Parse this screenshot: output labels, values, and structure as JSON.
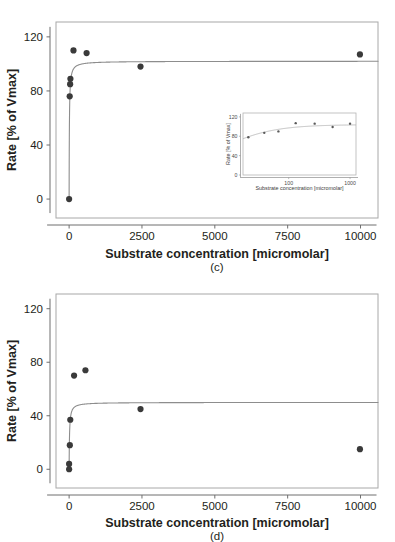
{
  "figure": {
    "caption_c": "(c)",
    "caption_d": "(d)"
  },
  "chart_data": [
    {
      "id": "panel-c",
      "type": "scatter",
      "title": "",
      "panel_label": "(c)",
      "xlabel": "Substrate concentration [micromolar]",
      "ylabel": "Rate [% of Vmax]",
      "xlim": [
        -450,
        10600
      ],
      "ylim": [
        -14,
        131
      ],
      "xticks": [
        0,
        2500,
        5000,
        7500,
        10000
      ],
      "xticklabels": [
        "0",
        "2500",
        "5000",
        "7500",
        "10000"
      ],
      "yticks": [
        0,
        40,
        80,
        120
      ],
      "yticklabels": [
        "0",
        "40",
        "80",
        "120"
      ],
      "grid": false,
      "legend": "none",
      "points": [
        {
          "x": 0,
          "y": 0
        },
        {
          "x": 20,
          "y": 76
        },
        {
          "x": 35,
          "y": 85
        },
        {
          "x": 45,
          "y": 89
        },
        {
          "x": 150,
          "y": 110
        },
        {
          "x": 600,
          "y": 108
        },
        {
          "x": 2450,
          "y": 98
        },
        {
          "x": 9980,
          "y": 107
        }
      ],
      "fit": {
        "model": "michaelis-menten",
        "vmax_percent": 102,
        "km_micromolar": 9,
        "description": "saturation curve rising steeply near zero then plateau at ~102"
      }
    },
    {
      "id": "panel-c-inset",
      "type": "scatter",
      "title": "",
      "xlabel": "Substrate concentration [micromolar]",
      "ylabel": "Rate [% of Vmax]",
      "xscale": "log",
      "xlim": [
        18,
        1250
      ],
      "ylim": [
        0,
        128
      ],
      "xticks": [
        100,
        1000
      ],
      "xticklabels": [
        "100",
        "1000"
      ],
      "yticks": [
        0,
        40,
        80,
        120
      ],
      "yticklabels": [
        "0",
        "40",
        "80",
        "120"
      ],
      "grid": false,
      "legend": "none",
      "points": [
        {
          "x": 22,
          "y": 78
        },
        {
          "x": 40,
          "y": 87
        },
        {
          "x": 68,
          "y": 90
        },
        {
          "x": 130,
          "y": 107
        },
        {
          "x": 265,
          "y": 106
        },
        {
          "x": 520,
          "y": 99
        },
        {
          "x": 1000,
          "y": 106
        }
      ],
      "fit": {
        "model": "michaelis-menten",
        "vmax_percent": 104,
        "description": "smooth rise on log axis flattening toward 104"
      }
    },
    {
      "id": "panel-d",
      "type": "scatter",
      "title": "",
      "panel_label": "(d)",
      "xlabel": "Substrate concentration [micromolar]",
      "ylabel": "Rate [% of Vmax]",
      "xlim": [
        -450,
        10600
      ],
      "ylim": [
        -14,
        131
      ],
      "xticks": [
        0,
        2500,
        5000,
        7500,
        10000
      ],
      "xticklabels": [
        "0",
        "2500",
        "5000",
        "7500",
        "10000"
      ],
      "yticks": [
        0,
        40,
        80,
        120
      ],
      "yticklabels": [
        "0",
        "40",
        "80",
        "120"
      ],
      "grid": false,
      "legend": "none",
      "points": [
        {
          "x": 0,
          "y": 0
        },
        {
          "x": 0,
          "y": 4
        },
        {
          "x": 25,
          "y": 18
        },
        {
          "x": 40,
          "y": 37
        },
        {
          "x": 170,
          "y": 70
        },
        {
          "x": 560,
          "y": 74
        },
        {
          "x": 2450,
          "y": 45
        },
        {
          "x": 9980,
          "y": 15
        }
      ],
      "fit": {
        "model": "michaelis-menten",
        "vmax_percent": 50,
        "km_micromolar": 14,
        "description": "saturation curve rising steeply near zero then plateau at ~50"
      }
    }
  ]
}
